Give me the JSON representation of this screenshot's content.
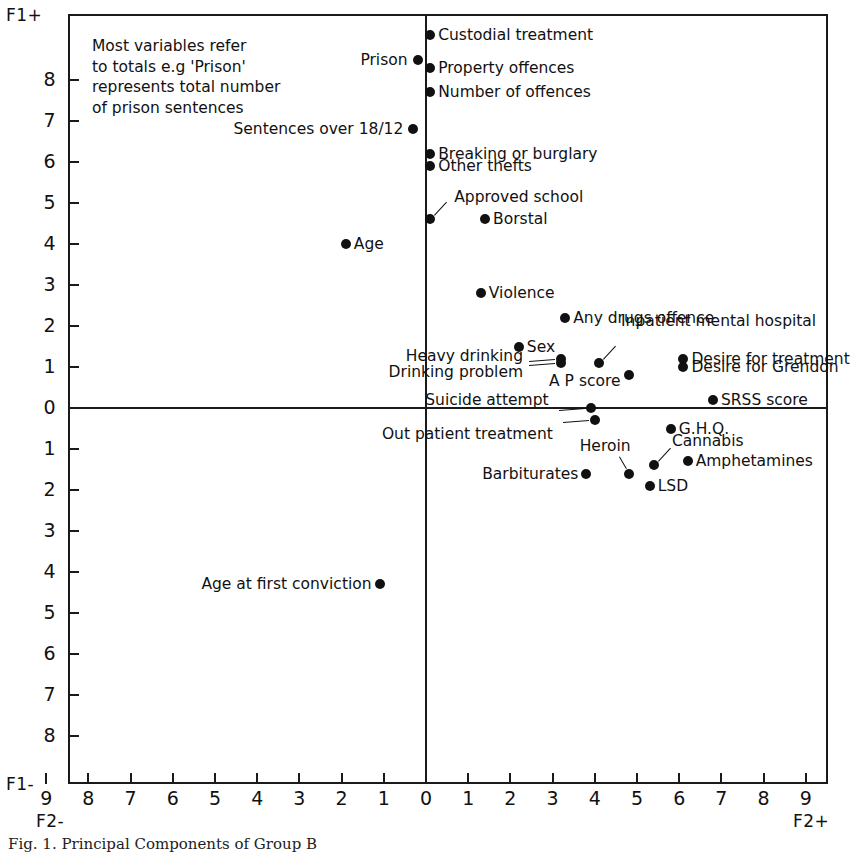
{
  "figure": {
    "caption": "Fig. 1.  Principal Components of Group B"
  },
  "axes": {
    "y_top_label": "F1+",
    "y_bottom_label": "F1-",
    "x_left_label": "F2-",
    "x_right_label": "F2+",
    "y_ticks": [
      "8",
      "7",
      "6",
      "5",
      "4",
      "3",
      "2",
      "1",
      "0",
      "1",
      "2",
      "3",
      "4",
      "5",
      "6",
      "7",
      "8"
    ],
    "y_tick_values": [
      8,
      7,
      6,
      5,
      4,
      3,
      2,
      1,
      0,
      -1,
      -2,
      -3,
      -4,
      -5,
      -6,
      -7,
      -8
    ],
    "x_ticks": [
      "9",
      "8",
      "7",
      "6",
      "5",
      "4",
      "3",
      "2",
      "1",
      "0",
      "1",
      "2",
      "3",
      "4",
      "5",
      "6",
      "7",
      "8",
      "9"
    ],
    "x_tick_values": [
      -9,
      -8,
      -7,
      -6,
      -5,
      -4,
      -3,
      -2,
      -1,
      0,
      1,
      2,
      3,
      4,
      5,
      6,
      7,
      8,
      9
    ]
  },
  "note": {
    "lines": [
      "Most variables refer",
      "to totals e.g 'Prison'",
      "represents total number",
      "of prison sentences"
    ],
    "text": "Most variables refer to totals e.g 'Prison' represents total number of prison sentences"
  },
  "chart_data": {
    "type": "scatter",
    "title": "Principal Components of Group B",
    "xlabel": "F2",
    "ylabel": "F1",
    "xlim": [
      -9.5,
      9.5
    ],
    "ylim": [
      -9.3,
      9.4
    ],
    "grid": false,
    "legend": "none",
    "points": [
      {
        "label": "Custodial treatment",
        "x": 0.1,
        "y": 9.1,
        "side": "right"
      },
      {
        "label": "Prison",
        "x": -0.2,
        "y": 8.5,
        "side": "left"
      },
      {
        "label": "Property offences",
        "x": 0.1,
        "y": 8.3,
        "side": "right"
      },
      {
        "label": "Number of offences",
        "x": 0.1,
        "y": 7.7,
        "side": "right"
      },
      {
        "label": "Sentences over 18/12",
        "x": -0.3,
        "y": 6.8,
        "side": "left"
      },
      {
        "label": "Breaking or burglary",
        "x": 0.1,
        "y": 6.2,
        "side": "right"
      },
      {
        "label": "Other thefts",
        "x": 0.1,
        "y": 5.9,
        "side": "right"
      },
      {
        "label": "Approved school",
        "x": 0.1,
        "y": 4.6,
        "side": "leader-up-right"
      },
      {
        "label": "Borstal",
        "x": 1.4,
        "y": 4.6,
        "side": "right"
      },
      {
        "label": "Age",
        "x": -1.9,
        "y": 4.0,
        "side": "right"
      },
      {
        "label": "Violence",
        "x": 1.3,
        "y": 2.8,
        "side": "right"
      },
      {
        "label": "Any drugs offence",
        "x": 3.3,
        "y": 2.2,
        "side": "right"
      },
      {
        "label": "Sex",
        "x": 2.2,
        "y": 1.5,
        "side": "right"
      },
      {
        "label": "Heavy drinking",
        "x": 3.2,
        "y": 1.2,
        "side": "leader-left"
      },
      {
        "label": "Drinking problem",
        "x": 3.2,
        "y": 1.1,
        "side": "leader-left"
      },
      {
        "label": "Inpatient mental hospital",
        "x": 4.1,
        "y": 1.1,
        "side": "leader-up-right"
      },
      {
        "label": "Desire for treatment",
        "x": 6.1,
        "y": 1.2,
        "side": "right"
      },
      {
        "label": "Desire for Grendon",
        "x": 6.1,
        "y": 1.0,
        "side": "right"
      },
      {
        "label": "A P score",
        "x": 4.8,
        "y": 0.8,
        "side": "left"
      },
      {
        "label": "SRSS score",
        "x": 6.8,
        "y": 0.2,
        "side": "right"
      },
      {
        "label": "Suicide attempt",
        "x": 3.9,
        "y": 0.0,
        "side": "leader-left"
      },
      {
        "label": "Out patient treatment",
        "x": 4.0,
        "y": -0.3,
        "side": "leader-left"
      },
      {
        "label": "G.H.Q.",
        "x": 5.8,
        "y": -0.5,
        "side": "right"
      },
      {
        "label": "Cannabis",
        "x": 5.4,
        "y": -1.4,
        "side": "leader-up-right"
      },
      {
        "label": "Amphetamines",
        "x": 6.2,
        "y": -1.3,
        "side": "right"
      },
      {
        "label": "Barbiturates",
        "x": 3.8,
        "y": -1.6,
        "side": "left"
      },
      {
        "label": "Heroin",
        "x": 4.8,
        "y": -1.6,
        "side": "leader-up-left"
      },
      {
        "label": "LSD",
        "x": 5.3,
        "y": -1.9,
        "side": "right"
      },
      {
        "label": "Age at first conviction",
        "x": -1.1,
        "y": -4.3,
        "side": "left"
      }
    ]
  }
}
